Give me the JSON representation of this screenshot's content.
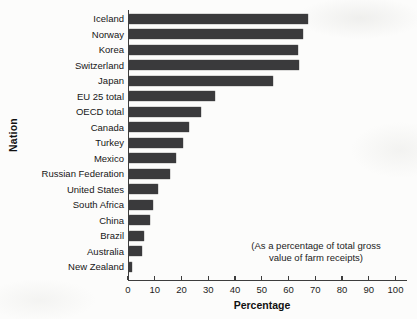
{
  "chart_data": {
    "type": "bar",
    "orientation": "horizontal",
    "title": "",
    "xlabel": "Percentage",
    "ylabel": "Nation",
    "xlim": [
      0,
      100
    ],
    "xticks": [
      0,
      10,
      20,
      30,
      40,
      50,
      60,
      70,
      80,
      90,
      100
    ],
    "grid": false,
    "legend": false,
    "bar_color": "#3a3a3c",
    "categories": [
      "Iceland",
      "Norway",
      "Korea",
      "Switzerland",
      "Japan",
      "EU 25 total",
      "OECD total",
      "Canada",
      "Turkey",
      "Mexico",
      "Russian Federation",
      "United States",
      "South Africa",
      "China",
      "Brazil",
      "Australia",
      "New Zealand"
    ],
    "values": [
      67,
      65,
      63,
      63.5,
      54,
      32,
      27,
      22.5,
      20,
      17.5,
      15.5,
      11,
      9,
      8,
      5.5,
      5,
      1
    ],
    "annotation": "(As a percentage of total gross value of farm receipts)",
    "annotation_lines": [
      "(As a percentage of total gross",
      "value of farm receipts)"
    ]
  }
}
